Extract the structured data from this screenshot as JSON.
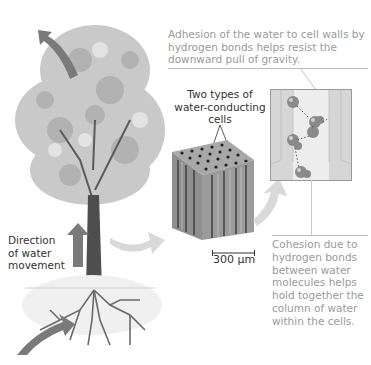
{
  "labels": {
    "adhesion": "Adhesion of the water to cell walls by hydrogen bonds helps resist the downward pull of gravity.",
    "two_types_line1": "Two types of",
    "two_types_line2": "water-conducting",
    "two_types_line3": "cells",
    "direction_line1": "Direction",
    "direction_line2": "of water",
    "direction_line3": "movement",
    "scale_bar": "300 µm",
    "cohesion": "Cohesion due to hydrogen bonds between water molecules helps hold together the column of water within the cells."
  },
  "figure": {
    "panels": [
      "tree-with-roots",
      "xylem-micrograph",
      "water-molecule-closeup"
    ],
    "arrow_color": "#7a7a7a",
    "light_arrow_color": "#d9d9d9"
  }
}
